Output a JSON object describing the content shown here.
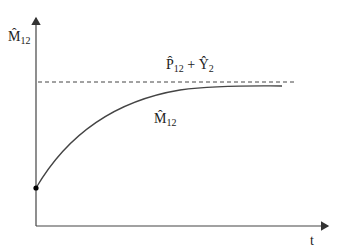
{
  "diagram": {
    "y_axis_label": {
      "symbol": "M̂",
      "subscript": "12"
    },
    "x_axis_label": "t",
    "asymptote_label": {
      "term1_symbol": "P̂",
      "term1_subscript": "12",
      "operator": "+",
      "term2_symbol": "Ŷ",
      "term2_subscript": "2"
    },
    "curve_label": {
      "symbol": "M̂",
      "subscript": "12"
    },
    "colors": {
      "axis": "#333333",
      "curve": "#333333",
      "dashed": "#333333",
      "start_point": "#000000"
    }
  }
}
